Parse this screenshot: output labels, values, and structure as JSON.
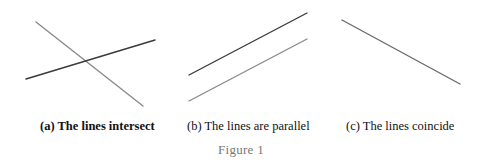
{
  "figure": {
    "title": "Figure 1",
    "panels": [
      {
        "id": "a",
        "caption": "(a)  The lines intersect",
        "lines": [
          {
            "name": "line-1",
            "x1": 36,
            "y1": 22,
            "x2": 143,
            "y2": 106,
            "color": "#8a8a8a"
          },
          {
            "name": "line-2",
            "x1": 26,
            "y1": 79,
            "x2": 155,
            "y2": 40,
            "color": "#3a3a3a"
          }
        ]
      },
      {
        "id": "b",
        "caption": "(b)  The lines are parallel",
        "lines": [
          {
            "name": "line-1",
            "x1": 189,
            "y1": 75,
            "x2": 307,
            "y2": 13,
            "color": "#3a3a3a"
          },
          {
            "name": "line-2",
            "x1": 189,
            "y1": 101,
            "x2": 307,
            "y2": 39,
            "color": "#8a8a8a"
          }
        ]
      },
      {
        "id": "c",
        "caption": "(c)  The lines coincide",
        "lines": [
          {
            "name": "line-1",
            "x1": 342,
            "y1": 20,
            "x2": 460,
            "y2": 84,
            "color": "#6a6a6a"
          }
        ]
      }
    ]
  }
}
